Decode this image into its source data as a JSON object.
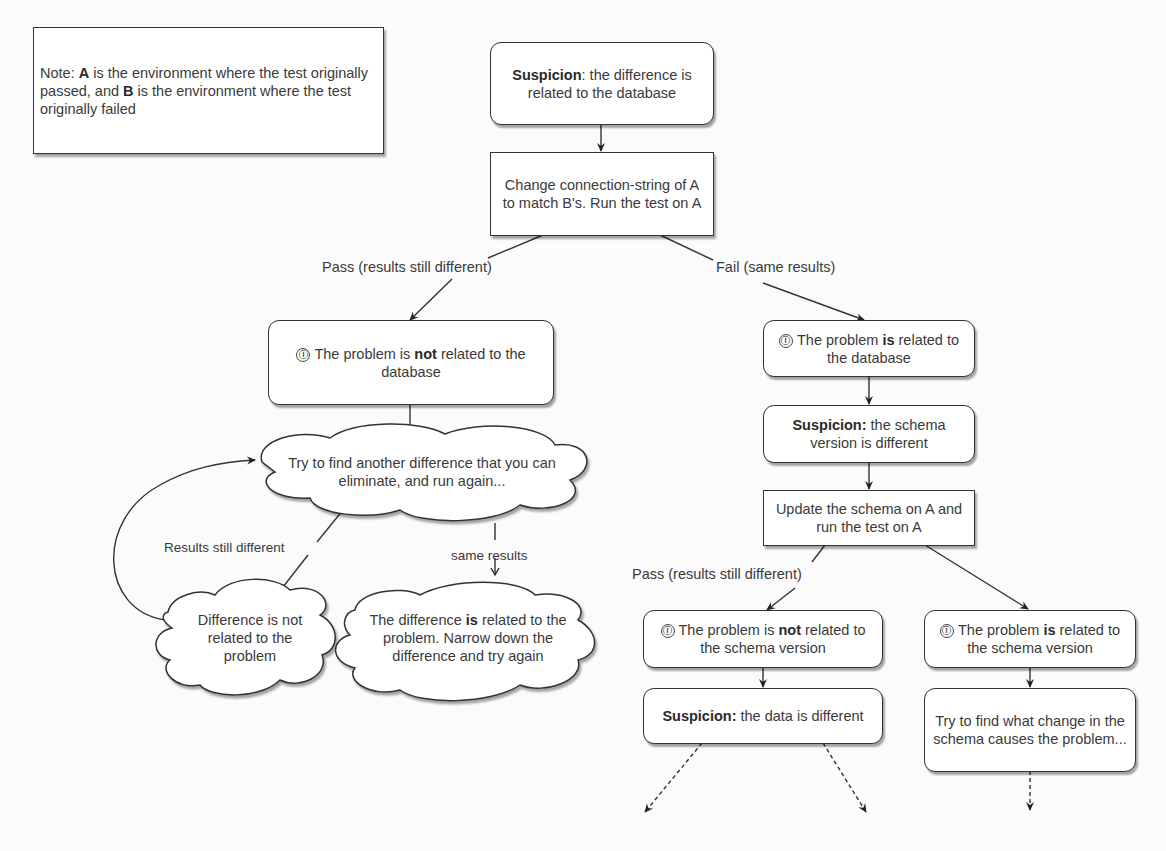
{
  "note": {
    "prefix": "Note: ",
    "a": "A",
    "mid": " is the environment where the test originally passed, and ",
    "b": "B",
    "suffix": " is the environment where the test originally failed"
  },
  "nodes": {
    "suspicion_db": {
      "bold": "Suspicion",
      "text": ": the difference is related to the database"
    },
    "change_conn": {
      "text": "Change connection-string of A to match B's. Run the test on A"
    },
    "not_related_db": {
      "icon": "info-icon",
      "pre": "The problem is ",
      "bold": "not",
      "post": " related to the database"
    },
    "is_related_db": {
      "icon": "info-icon",
      "pre": "The problem ",
      "bold": "is",
      "post": " related to the database"
    },
    "suspicion_schema": {
      "bold": "Suspicion:",
      "text": " the schema version is different"
    },
    "update_schema": {
      "text": "Update the schema on A and run the test on A"
    },
    "not_related_schema": {
      "icon": "info-icon",
      "pre": "The problem is ",
      "bold": "not",
      "post": " related to the schema version"
    },
    "is_related_schema": {
      "icon": "info-icon",
      "pre": "The problem ",
      "bold": "is",
      "post": " related to the schema version"
    },
    "suspicion_data": {
      "bold": "Suspicion:",
      "text": " the data is different"
    },
    "find_schema_change": {
      "text": "Try to find what change in the schema causes the problem..."
    }
  },
  "clouds": {
    "try_another": {
      "text": "Try to find another difference that you can eliminate, and run again..."
    },
    "diff_not_related": {
      "text": "Difference is not related to the problem"
    },
    "diff_is_related": {
      "pre": "The difference ",
      "bold": "is",
      "post": " related to the problem. Narrow down the difference and try again"
    }
  },
  "edge_labels": {
    "pass_db": "Pass (results still different)",
    "fail_db": "Fail (same results)",
    "results_still_different": "Results still different",
    "same_results": "same results",
    "pass_schema": "Pass (results still different)"
  },
  "icons": {
    "info": "ⓘ"
  },
  "colors": {
    "stroke": "#333333",
    "background": "#fbfbfb",
    "node_fill": "#ffffff",
    "text": "#3a3a3a"
  }
}
